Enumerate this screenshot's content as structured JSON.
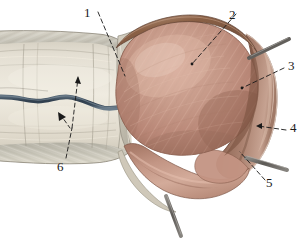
{
  "figure": {
    "type": "anatomical-illustration",
    "background_color": "#ffffff",
    "width": 305,
    "height": 239
  },
  "labels": [
    {
      "id": "1",
      "text": "1",
      "x": 84,
      "y": 6,
      "leader": "dashed",
      "target": "tunica-vaginalis-parietal-edge"
    },
    {
      "id": "2",
      "text": "2",
      "x": 229,
      "y": 8,
      "leader": "dashed",
      "target": "testis-body"
    },
    {
      "id": "3",
      "text": "3",
      "x": 288,
      "y": 59,
      "leader": "dashed",
      "target": "tunica-vaginalis-lateral-wall"
    },
    {
      "id": "4",
      "text": "4",
      "x": 290,
      "y": 121,
      "leader": "dashed",
      "target": "tunica-vaginalis-cavity"
    },
    {
      "id": "5",
      "text": "5",
      "x": 266,
      "y": 176,
      "leader": "dashed",
      "target": "epididymis-tail-sinus"
    },
    {
      "id": "6",
      "text": "6",
      "x": 57,
      "y": 160,
      "leader": "dashed",
      "target": "spermatic-cord-coverings"
    }
  ],
  "colors": {
    "testis_light": "#cfa293",
    "testis_mid": "#bd8a79",
    "testis_dark": "#a06f5f",
    "tunica_outer": "#9c6d59",
    "tunica_dark": "#7d5443",
    "epididymis_fold": "#c69a89",
    "cord_fascia": "#cfc9bb",
    "cord_fascia_light": "#e2ddd1",
    "cord_fascia_gray": "#b8b5aa",
    "vessel_blue": "#3b4a5a",
    "probe_metal": "#6d6a66",
    "probe_metal_light": "#a09d98",
    "outline": "#4a3a30",
    "label_text": "#1a1a1a",
    "leader_line": "#1a1a1a"
  }
}
